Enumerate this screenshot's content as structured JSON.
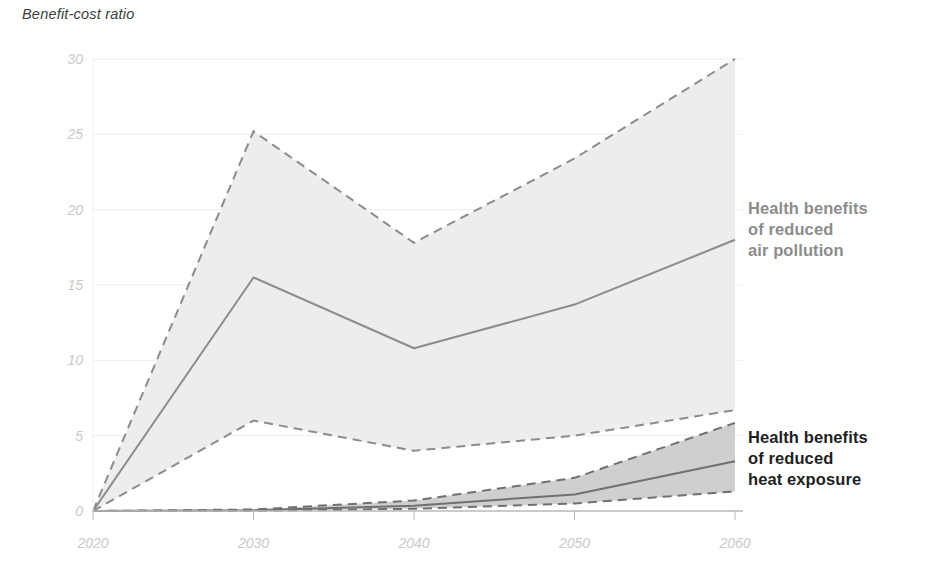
{
  "axis_title": "Benefit-cost ratio",
  "labels": {
    "air": "Health benefits\nof reduced\nair pollution",
    "heat": "Health benefits\nof reduced\nheat exposure"
  },
  "colors": {
    "air_band": "#ededed",
    "air_line": "#8c8c8c",
    "air_text": "#8c8c8c",
    "heat_band": "#cfcfcf",
    "heat_line": "#707070",
    "heat_text": "#1f1f1f",
    "grid": "#ededed",
    "axis": "#b8b8b8",
    "tick_text": "#c9c9c9",
    "title_text": "#3d3d3d"
  },
  "chart_data": {
    "type": "area",
    "title": "Benefit-cost ratio",
    "xlabel": "",
    "ylabel": "Benefit-cost ratio",
    "x": [
      2020,
      2030,
      2040,
      2050,
      2060
    ],
    "xtick_labels": [
      "2020",
      "2030",
      "2040",
      "2050",
      "2060"
    ],
    "ytick_labels": [
      "0",
      "5",
      "10",
      "15",
      "20",
      "25",
      "30"
    ],
    "yticks": [
      0,
      5,
      10,
      15,
      20,
      25,
      30
    ],
    "ylim": [
      0,
      30
    ],
    "xlim": [
      2020,
      2060
    ],
    "grid": true,
    "legend_position": "right-inline",
    "series": [
      {
        "name": "Health benefits of reduced air pollution",
        "style": "solid-median-with-dashed-range",
        "values": [
          0,
          15.5,
          10.8,
          13.7,
          18.0
        ],
        "upper": [
          0,
          25.2,
          17.8,
          23.4,
          30.0
        ],
        "lower": [
          0,
          6.0,
          4.0,
          5.0,
          6.7
        ],
        "band_color": "#ededed",
        "line_color": "#8c8c8c"
      },
      {
        "name": "Health benefits of reduced heat exposure",
        "style": "solid-median-with-dashed-range",
        "values": [
          0,
          0.05,
          0.35,
          1.1,
          3.3
        ],
        "upper": [
          0,
          0.1,
          0.7,
          2.2,
          5.85
        ],
        "lower": [
          0,
          0.0,
          0.15,
          0.5,
          1.3
        ],
        "band_color": "#cfcfcf",
        "line_color": "#707070"
      }
    ]
  }
}
